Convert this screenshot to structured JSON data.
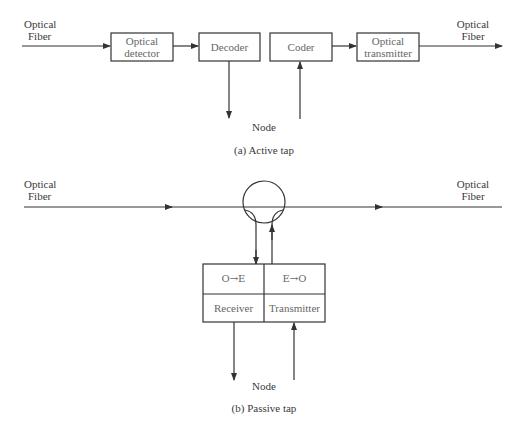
{
  "diagram_a": {
    "caption": "(a) Active tap",
    "input_label_1": "Optical",
    "input_label_2": "Fiber",
    "output_label_1": "Optical",
    "output_label_2": "Fiber",
    "blocks": [
      {
        "line1": "Optical",
        "line2": "detector"
      },
      {
        "line1": "Decoder"
      },
      {
        "line1": "Coder"
      },
      {
        "line1": "Optical",
        "line2": "transmitter"
      }
    ],
    "node_label": "Node"
  },
  "diagram_b": {
    "caption": "(b) Passive tap",
    "input_label_1": "Optical",
    "input_label_2": "Fiber",
    "output_label_1": "Optical",
    "output_label_2": "Fiber",
    "oe_label": "O→E",
    "eo_label": "E→O",
    "receiver_label": "Receiver",
    "transmitter_label": "Transmitter",
    "node_label": "Node"
  }
}
